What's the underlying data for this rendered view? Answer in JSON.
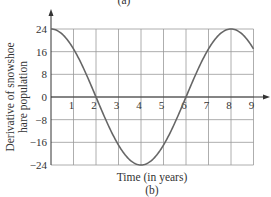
{
  "chart_data": {
    "type": "line",
    "title": "",
    "panel_label": "(b)",
    "top_label_partial": "(a)",
    "xlabel": "Time (in years)",
    "ylabel": "Derivative of snowshoe hare population",
    "ylabel_lines": [
      "Derivative of snowshoe",
      "hare population"
    ],
    "xlim": [
      0,
      9
    ],
    "ylim": [
      -24,
      24
    ],
    "x_ticks": [
      1,
      2,
      3,
      4,
      5,
      6,
      7,
      8,
      9
    ],
    "x_tick_labels": [
      "1",
      "2",
      "3",
      "4",
      "5",
      "6",
      "7",
      "8",
      "9"
    ],
    "y_ticks": [
      24,
      16,
      8,
      0,
      -8,
      -16,
      -24
    ],
    "y_tick_labels": [
      "24",
      "16",
      "8",
      "0",
      "−8",
      "−16",
      "−24"
    ],
    "grid": true,
    "legend": null,
    "series": [
      {
        "name": "derivative",
        "x": [
          0,
          0.5,
          1,
          1.5,
          2,
          2.5,
          3,
          3.5,
          4,
          4.5,
          5,
          5.5,
          6,
          6.5,
          7,
          7.5,
          8,
          8.5,
          9
        ],
        "values": [
          24,
          22.2,
          17,
          9.2,
          0,
          -9.2,
          -17,
          -22.2,
          -24,
          -22.2,
          -17,
          -9.2,
          0,
          9.2,
          17,
          22.2,
          24,
          22.2,
          17
        ],
        "formula": "24*cos(pi*t/4)"
      }
    ]
  }
}
